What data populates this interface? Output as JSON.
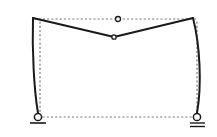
{
  "diagram": {
    "type": "structural-frame-deflection",
    "description": "Three-hinged portal frame: original geometry (dotted) and deformed shape (solid)",
    "colors": {
      "background": "#ffffff",
      "deformed_line": "#1a1a1a",
      "original_dotted": "#777777",
      "hinge_fill": "#ffffff"
    },
    "original_frame": {
      "style": "dotted",
      "nodes": {
        "top_left": [
          35,
          19
        ],
        "top_hinge": [
          118,
          19
        ],
        "top_right": [
          196,
          19
        ],
        "bottom_left": [
          38,
          117
        ],
        "bottom_right": [
          197,
          117
        ]
      }
    },
    "deformed_frame": {
      "style": "solid",
      "nodes": {
        "top_left": [
          33,
          18
        ],
        "mid_hinge": [
          114,
          37
        ],
        "top_right": [
          193,
          18
        ],
        "bottom_left": [
          38,
          117
        ],
        "bottom_right": [
          197,
          117
        ]
      }
    },
    "supports": [
      {
        "name": "left-pin-support",
        "kind": "pin",
        "position": [
          38,
          117
        ],
        "ground_lines": 1
      },
      {
        "name": "right-roller-support",
        "kind": "roller",
        "position": [
          197,
          117
        ],
        "ground_lines": 2
      }
    ],
    "hinges": [
      {
        "name": "original-crown-hinge",
        "position": [
          118,
          19
        ]
      },
      {
        "name": "deformed-crown-hinge",
        "position": [
          114,
          37
        ]
      }
    ]
  }
}
